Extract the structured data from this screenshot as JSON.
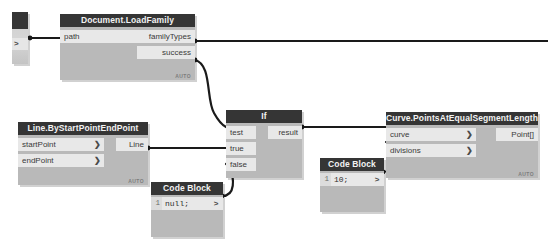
{
  "app": {
    "name": "Dynamo Node Graph",
    "canvas_background": "#ffffff",
    "node_body_color": "#b9b9b9",
    "node_header_color": "#353535",
    "port_color": "#e8e8e8",
    "wire_color": "#1a1a1a"
  },
  "nodes": [
    {
      "id": "filepath",
      "name": "file-path-node",
      "title": "",
      "x": 12,
      "y": 12,
      "w": 16,
      "h": 52,
      "outputs": [
        {
          "label": ">",
          "y": 26
        }
      ],
      "inputs": [],
      "auto_badge": ""
    },
    {
      "id": "loadfamily",
      "name": "document-load-family-node",
      "title": "Document.LoadFamily",
      "x": 60,
      "y": 14,
      "w": 135,
      "h": 66,
      "inputs": [
        {
          "label": "path",
          "y": 0,
          "w": 90,
          "caret": ">"
        }
      ],
      "outputs": [
        {
          "label": "familyTypes",
          "y": 0,
          "w": 58
        },
        {
          "label": "success",
          "y": 16,
          "w": 58
        }
      ],
      "auto_badge": "AUTO"
    },
    {
      "id": "linenode",
      "name": "line-by-start-point-end-point-node",
      "title": "Line.ByStartPointEndPoint",
      "x": 18,
      "y": 122,
      "w": 130,
      "h": 63,
      "inputs": [
        {
          "label": "startPoint",
          "y": 0,
          "w": 86,
          "caret": ">"
        },
        {
          "label": "endPoint",
          "y": 16,
          "w": 86,
          "caret": ">"
        }
      ],
      "outputs": [
        {
          "label": "Line",
          "y": 0,
          "w": 32
        }
      ],
      "auto_badge": "AUTO"
    },
    {
      "id": "ifnode",
      "name": "if-node",
      "title": "If",
      "x": 226,
      "y": 110,
      "w": 76,
      "h": 68,
      "inputs": [
        {
          "label": "test",
          "y": 0,
          "w": 30
        },
        {
          "label": "true",
          "y": 16,
          "w": 30
        },
        {
          "label": "false",
          "y": 32,
          "w": 30
        }
      ],
      "outputs": [
        {
          "label": "result",
          "y": 0,
          "w": 34
        }
      ],
      "auto_badge": ""
    },
    {
      "id": "curvenode",
      "name": "curve-points-at-equal-segment-length-node",
      "title": "Curve.PointsAtEqualSegmentLength",
      "x": 386,
      "y": 112,
      "w": 152,
      "h": 66,
      "inputs": [
        {
          "label": "curve",
          "y": 0,
          "w": 90,
          "caret": ">"
        },
        {
          "label": "divisions",
          "y": 16,
          "w": 90,
          "caret": ">"
        }
      ],
      "outputs": [
        {
          "label": "Point[]",
          "y": 0,
          "w": 42
        }
      ],
      "auto_badge": "AUTO"
    }
  ],
  "code_blocks": [
    {
      "id": "cb-null",
      "name": "code-block-node-null",
      "title": "Code Block",
      "x": 151,
      "y": 182,
      "w": 72,
      "h": 55,
      "lines": [
        {
          "number": "1",
          "code": "null;"
        }
      ],
      "out_caret": ">"
    },
    {
      "id": "cb-ten",
      "name": "code-block-node-ten",
      "title": "Code Block",
      "x": 320,
      "y": 158,
      "w": 64,
      "h": 54,
      "lines": [
        {
          "number": "1",
          "code": "10;"
        }
      ],
      "out_caret": ">"
    }
  ],
  "wires": [
    {
      "name": "wire-filepath-to-path",
      "d": "M 30 38 L 60 38"
    },
    {
      "name": "wire-familytypes-out",
      "d": "M 195 41 L 548 41"
    },
    {
      "name": "wire-success-to-test",
      "d": "M 195 60 C 212 64 206 100 214 113 C 219 122 222 125 226 127"
    },
    {
      "name": "wire-line-to-true",
      "d": "M 148 148 L 226 148"
    },
    {
      "name": "wire-codeblock-to-false",
      "d": "M 222 196 C 236 196 234 178 230 168 C 229 166 228 165 226 164"
    },
    {
      "name": "wire-result-to-curve",
      "d": "M 302 127 L 386 127"
    },
    {
      "name": "wire-ten-to-divisions",
      "d": "M 383 172 C 396 172 394 154 390 146 C 388 143 387 142 386 142"
    }
  ]
}
